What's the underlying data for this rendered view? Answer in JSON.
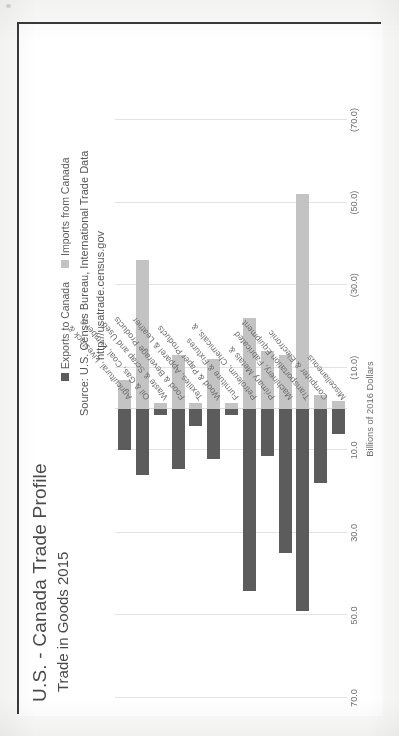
{
  "header": {
    "title": "U.S. - Canada Trade Profile",
    "subtitle": "Trade in Goods 2015"
  },
  "source": {
    "line1": "Source: U.S. Census Bureau, International Trade Data",
    "line2": "http://usatrade.census.gov"
  },
  "legend": {
    "exports_label": "Exports to Canada",
    "imports_label": "Imports from Canada",
    "exports_color": "#5c5c5c",
    "imports_color": "#c3c3c3"
  },
  "chart_data": {
    "type": "bar",
    "orientation": "horizontal",
    "title": "U.S. - Canada Trade Profile",
    "subtitle": "Trade in Goods 2015",
    "xlabel": "Billions of 2016 Dollars",
    "ylabel": "",
    "xlim": [
      70.0,
      -70.0
    ],
    "grid": true,
    "legend_position": "top-right",
    "tick_labels": [
      "70.0",
      "50.0",
      "30.0",
      "10.0",
      "(10.0)",
      "(30.0)",
      "(50.0)",
      "(70.0)"
    ],
    "tick_values": [
      70,
      50,
      30,
      10,
      -10,
      -30,
      -50,
      -70
    ],
    "categories": [
      "Agricultural, Livestock &",
      "Oil & Gas, Coal, Lumber &",
      "Waste & Scrap and Used",
      "Food & Beverage Products",
      "Textiles, Apparel & Leather",
      "Wood & Paper Products",
      "Furniture & Fixtures",
      "Petroleum, Chemicals, &",
      "Primary Metals &",
      "Machinery, Fabricated",
      "Transportation Equipment",
      "Computer & Electronic",
      "Miscellaneous"
    ],
    "series": [
      {
        "name": "Exports to Canada",
        "color": "#5c5c5c",
        "values": [
          10.0,
          16.0,
          1.5,
          14.5,
          4.0,
          12.0,
          1.5,
          44.0,
          11.5,
          35.0,
          49.0,
          18.0,
          6.0
        ]
      },
      {
        "name": "Imports from Canada",
        "color": "#c3c3c3",
        "values": [
          7.0,
          36.0,
          1.5,
          13.0,
          1.5,
          12.0,
          1.5,
          22.0,
          14.0,
          13.0,
          52.0,
          3.5,
          2.0
        ]
      }
    ],
    "units": "Billions of 2016 Dollars"
  }
}
